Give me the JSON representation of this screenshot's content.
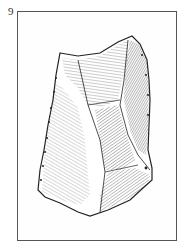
{
  "figure": {
    "number": "9",
    "colors": {
      "ink": "#222222",
      "frame": "#555555",
      "background": "#ffffff"
    }
  }
}
